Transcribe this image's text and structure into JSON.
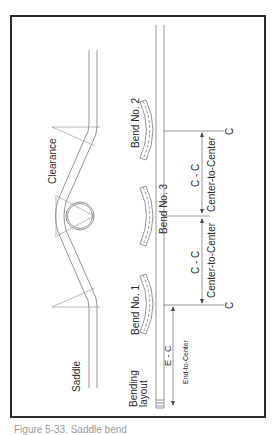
{
  "figure": {
    "type": "technical-drawing",
    "labels": {
      "saddle": "Saddle",
      "clearance": "Clearance",
      "bending_layout_line1": "Bending",
      "bending_layout_line2": "layout",
      "bend_1": "Bend No. 1",
      "bend_2": "Bend No. 2",
      "bend_3": "Bend No. 3",
      "cc_upper": "C - C",
      "cc_lower": "C - C",
      "center_to_center_upper": "Center-to-Center",
      "center_to_center_lower": "Center-to-Center",
      "ec": "E - C",
      "end_to_center": "End-to-Center",
      "c_top": "C",
      "c_bottom": "C"
    },
    "caption": "Figure 5-33. Saddle bend",
    "colors": {
      "line": "#8a8a8a",
      "frame": "#2b2b2b",
      "text": "#2a2a2a",
      "background": "#ffffff"
    }
  }
}
